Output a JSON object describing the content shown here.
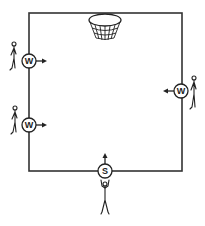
{
  "diagram": {
    "type": "basketball-drill",
    "court": {
      "x": 29,
      "y": 13,
      "width": 153,
      "height": 158,
      "stroke": "#333333"
    },
    "basket": {
      "cx": 105,
      "cy": 20
    },
    "players": [
      {
        "id": "w1",
        "label": "W",
        "role": "wing",
        "side": "left",
        "cx": 29,
        "cy": 61,
        "arrow": "right"
      },
      {
        "id": "w2",
        "label": "W",
        "role": "wing",
        "side": "left",
        "cx": 29,
        "cy": 125,
        "arrow": "right"
      },
      {
        "id": "w3",
        "label": "W",
        "role": "wing",
        "side": "right",
        "cx": 181,
        "cy": 91,
        "arrow": "left"
      },
      {
        "id": "s1",
        "label": "S",
        "role": "shooter",
        "side": "bottom",
        "cx": 105,
        "cy": 171,
        "arrow": "up"
      }
    ]
  }
}
